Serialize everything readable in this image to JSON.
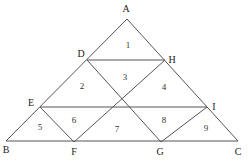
{
  "diagram": {
    "type": "triangle-subdivision",
    "vertices": [
      {
        "id": "A",
        "label": "A"
      },
      {
        "id": "B",
        "label": "B"
      },
      {
        "id": "C",
        "label": "C"
      },
      {
        "id": "D",
        "label": "D"
      },
      {
        "id": "E",
        "label": "E"
      },
      {
        "id": "F",
        "label": "F"
      },
      {
        "id": "G",
        "label": "G"
      },
      {
        "id": "H",
        "label": "H"
      },
      {
        "id": "I",
        "label": "I"
      }
    ],
    "segments": [
      [
        "A",
        "B"
      ],
      [
        "A",
        "C"
      ],
      [
        "B",
        "C"
      ],
      [
        "D",
        "H"
      ],
      [
        "E",
        "I"
      ],
      [
        "D",
        "G"
      ],
      [
        "H",
        "F"
      ],
      [
        "E",
        "F"
      ],
      [
        "I",
        "G"
      ]
    ],
    "regions": [
      {
        "id": "r1",
        "label": "1"
      },
      {
        "id": "r2",
        "label": "2"
      },
      {
        "id": "r3",
        "label": "3"
      },
      {
        "id": "r4",
        "label": "4"
      },
      {
        "id": "r5",
        "label": "5"
      },
      {
        "id": "r6",
        "label": "6"
      },
      {
        "id": "r7",
        "label": "7"
      },
      {
        "id": "r8",
        "label": "8"
      },
      {
        "id": "r9",
        "label": "9"
      }
    ],
    "caption": ""
  }
}
